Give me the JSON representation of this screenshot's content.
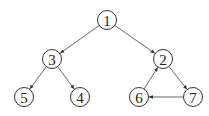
{
  "diagram": {
    "type": "directed-graph",
    "nodes": [
      {
        "id": "1",
        "label": "1",
        "x": 107,
        "y": 20
      },
      {
        "id": "3",
        "label": "3",
        "x": 52,
        "y": 59
      },
      {
        "id": "2",
        "label": "2",
        "x": 163,
        "y": 59
      },
      {
        "id": "5",
        "label": "5",
        "x": 24,
        "y": 97
      },
      {
        "id": "4",
        "label": "4",
        "x": 80,
        "y": 97
      },
      {
        "id": "6",
        "label": "6",
        "x": 139,
        "y": 97
      },
      {
        "id": "7",
        "label": "7",
        "x": 193,
        "y": 97
      }
    ],
    "edges": [
      {
        "from": "1",
        "to": "3"
      },
      {
        "from": "1",
        "to": "2"
      },
      {
        "from": "3",
        "to": "5"
      },
      {
        "from": "3",
        "to": "4"
      },
      {
        "from": "2",
        "to": "7"
      },
      {
        "from": "7",
        "to": "6"
      },
      {
        "from": "6",
        "to": "2"
      }
    ],
    "node_radius": 9.5
  }
}
